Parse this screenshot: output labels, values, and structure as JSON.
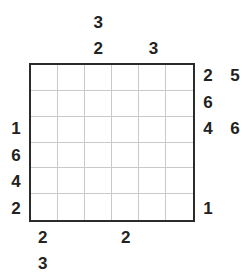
{
  "puzzle": {
    "type": "skyscrapers-grid",
    "grid": {
      "columns": 6,
      "rows": 6,
      "cell_values": [
        [
          "",
          "",
          "",
          "",
          "",
          ""
        ],
        [
          "",
          "",
          "",
          "",
          "",
          ""
        ],
        [
          "",
          "",
          "",
          "",
          "",
          ""
        ],
        [
          "",
          "",
          "",
          "",
          "",
          ""
        ],
        [
          "",
          "",
          "",
          "",
          "",
          ""
        ],
        [
          "",
          "",
          "",
          "",
          "",
          ""
        ]
      ]
    },
    "clues": {
      "top_outer": [
        "",
        "",
        "3",
        "",
        "",
        ""
      ],
      "top_inner": [
        "",
        "",
        "2",
        "",
        "3",
        ""
      ],
      "bottom_inner": [
        "2",
        "",
        "",
        "2",
        "",
        ""
      ],
      "bottom_outer": [
        "3",
        "",
        "",
        "",
        "",
        ""
      ],
      "left_inner": [
        "",
        "",
        "1",
        "6",
        "4",
        "2"
      ],
      "right_inner": [
        "2",
        "6",
        "4",
        "",
        "",
        "1"
      ],
      "right_outer": [
        "5",
        "",
        "6",
        "",
        "",
        ""
      ]
    },
    "colors": {
      "border": "#2b2b2b",
      "gridline": "#c9c9c9",
      "text": "#222222",
      "background": "#ffffff"
    }
  }
}
